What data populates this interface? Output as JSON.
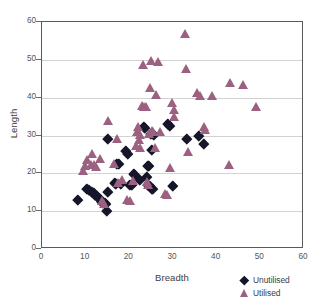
{
  "chart_data": {
    "type": "scatter",
    "title": "",
    "xlabel": "Breadth",
    "ylabel": "Length",
    "xlim": [
      0,
      60
    ],
    "ylim": [
      0,
      60
    ],
    "xticks": [
      0,
      10,
      20,
      30,
      40,
      50,
      60
    ],
    "yticks": [
      0,
      10,
      20,
      30,
      40,
      50,
      60
    ],
    "grid": "horizontal",
    "legend_position": "bottom-right",
    "series": [
      {
        "name": "Unutilised",
        "marker": "diamond",
        "color": "#16162b",
        "points": [
          [
            8.1,
            12.9
          ],
          [
            10.2,
            15.9
          ],
          [
            10.8,
            15.6
          ],
          [
            11.3,
            15.2
          ],
          [
            11.8,
            14.8
          ],
          [
            12.2,
            14.4
          ],
          [
            12.6,
            14.0
          ],
          [
            12.9,
            13.6
          ],
          [
            13.2,
            13.2
          ],
          [
            13.5,
            12.9
          ],
          [
            13.8,
            12.6
          ],
          [
            14.0,
            12.3
          ],
          [
            14.3,
            12.1
          ],
          [
            14.6,
            11.9
          ],
          [
            14.9,
            10.0
          ],
          [
            15.1,
            15.1
          ],
          [
            15.0,
            29.0
          ],
          [
            16.6,
            17.5
          ],
          [
            17.0,
            17.3
          ],
          [
            17.2,
            22.4
          ],
          [
            17.6,
            22.6
          ],
          [
            18.1,
            17.2
          ],
          [
            19.2,
            26.0
          ],
          [
            19.6,
            25.2
          ],
          [
            20.0,
            17.0
          ],
          [
            20.6,
            17.0
          ],
          [
            21.0,
            20.0
          ],
          [
            21.2,
            19.7
          ],
          [
            22.4,
            18.2
          ],
          [
            23.2,
            32.3
          ],
          [
            23.6,
            32.0
          ],
          [
            23.9,
            19.0
          ],
          [
            24.2,
            22.1
          ],
          [
            24.5,
            22.0
          ],
          [
            24.3,
            17.0
          ],
          [
            24.8,
            16.8
          ],
          [
            25.1,
            16.0
          ],
          [
            25.4,
            16.0
          ],
          [
            25.0,
            30.4
          ],
          [
            25.6,
            30.2
          ],
          [
            25.2,
            26.2
          ],
          [
            28.9,
            33.0
          ],
          [
            29.2,
            32.6
          ],
          [
            30.0,
            16.7
          ],
          [
            33.2,
            29.0
          ],
          [
            35.8,
            30.0
          ],
          [
            37.1,
            27.7
          ]
        ]
      },
      {
        "name": "Utilised",
        "marker": "triangle",
        "color": "#9c6180",
        "points": [
          [
            9.5,
            20.8
          ],
          [
            10.0,
            22.1
          ],
          [
            10.4,
            23.5
          ],
          [
            11.2,
            22.4
          ],
          [
            11.6,
            25.3
          ],
          [
            12.0,
            22.4
          ],
          [
            12.4,
            21.8
          ],
          [
            13.3,
            23.9
          ],
          [
            13.8,
            12.7
          ],
          [
            14.2,
            11.9
          ],
          [
            15.1,
            33.8
          ],
          [
            16.6,
            22.5
          ],
          [
            17.2,
            29.2
          ],
          [
            17.5,
            17.5
          ],
          [
            18.4,
            18.3
          ],
          [
            19.6,
            13.0
          ],
          [
            20.2,
            12.9
          ],
          [
            20.8,
            18.0
          ],
          [
            21.5,
            27.4
          ],
          [
            21.8,
            31.0
          ],
          [
            22.0,
            32.2
          ],
          [
            22.2,
            28.8
          ],
          [
            22.4,
            30.2
          ],
          [
            22.6,
            26.9
          ],
          [
            22.9,
            37.8
          ],
          [
            23.2,
            48.8
          ],
          [
            23.5,
            37.6
          ],
          [
            23.8,
            37.5
          ],
          [
            24.1,
            17.9
          ],
          [
            24.3,
            17.0
          ],
          [
            24.6,
            30.6
          ],
          [
            24.8,
            42.6
          ],
          [
            25.0,
            49.8
          ],
          [
            25.3,
            31.2
          ],
          [
            25.6,
            31.0
          ],
          [
            25.9,
            26.8
          ],
          [
            26.2,
            40.8
          ],
          [
            26.6,
            49.5
          ],
          [
            27.0,
            31.0
          ],
          [
            28.2,
            14.5
          ],
          [
            28.6,
            14.3
          ],
          [
            29.3,
            21.4
          ],
          [
            29.8,
            38.8
          ],
          [
            30.2,
            35.0
          ],
          [
            30.4,
            36.9
          ],
          [
            32.8,
            56.9
          ],
          [
            33.1,
            47.6
          ],
          [
            33.5,
            25.6
          ],
          [
            35.6,
            41.2
          ],
          [
            36.3,
            40.5
          ],
          [
            37.1,
            32.2
          ],
          [
            37.4,
            31.6
          ],
          [
            39.0,
            40.4
          ],
          [
            42.9,
            22.3
          ],
          [
            43.2,
            44.0
          ],
          [
            46.2,
            43.5
          ],
          [
            49.0,
            37.6
          ]
        ]
      }
    ]
  },
  "legend": {
    "items": [
      {
        "label": "Unutilised",
        "marker": "diamond"
      },
      {
        "label": "Utilised",
        "marker": "triangle"
      }
    ]
  }
}
